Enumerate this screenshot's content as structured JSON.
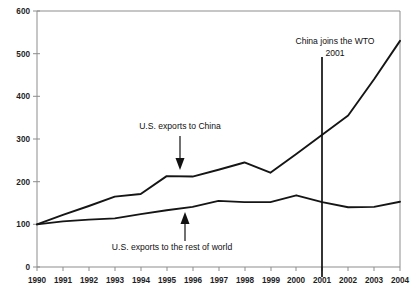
{
  "chart_data": {
    "type": "line",
    "title": "",
    "subtitle": "",
    "xlabel": "",
    "ylabel": "",
    "xlim": [
      1990,
      2004
    ],
    "ylim": [
      0,
      600
    ],
    "grid": false,
    "legend_position": "inline-annotations",
    "x": [
      1990,
      1991,
      1992,
      1993,
      1994,
      1995,
      1996,
      1997,
      1998,
      1999,
      2000,
      2001,
      2002,
      2003,
      2004
    ],
    "xtick_labels": [
      "1990",
      "1991",
      "1992",
      "1993",
      "1994",
      "1995",
      "1996",
      "1997",
      "1998",
      "1999",
      "2000",
      "2001",
      "2002",
      "2003",
      "2004"
    ],
    "ytick_labels": [
      "0",
      "100",
      "200",
      "300",
      "400",
      "500",
      "600"
    ],
    "ytick_values": [
      0,
      100,
      200,
      300,
      400,
      500,
      600
    ],
    "series": [
      {
        "name": "U.S. exports to China",
        "color": "#151515",
        "values": [
          100,
          122,
          143,
          165,
          171,
          213,
          212,
          228,
          245,
          221,
          265,
          310,
          355,
          440,
          530
        ]
      },
      {
        "name": "U.S. exports to the rest of world",
        "color": "#151515",
        "values": [
          100,
          107,
          111,
          114,
          124,
          133,
          141,
          155,
          152,
          152,
          168,
          152,
          140,
          141,
          153
        ]
      }
    ],
    "annotations": [
      {
        "id": "china-series-label",
        "text": "U.S. exports to China",
        "points_to_year": 1995,
        "arrow_direction": "down"
      },
      {
        "id": "rest-of-world-series-label",
        "text": "U.S. exports to the rest of world",
        "points_to_year": 1996,
        "arrow_direction": "up"
      },
      {
        "id": "wto-event",
        "text_line_1": "China joins the WTO",
        "text_line_2": "2001",
        "event_year": 2001,
        "marker": "vertical-line"
      }
    ]
  },
  "axes": {
    "y_ticks": [
      {
        "label": "600",
        "value": 600
      },
      {
        "label": "500",
        "value": 500
      },
      {
        "label": "400",
        "value": 400
      },
      {
        "label": "300",
        "value": 300
      },
      {
        "label": "200",
        "value": 200
      },
      {
        "label": "100",
        "value": 100
      },
      {
        "label": "0",
        "value": 0
      }
    ],
    "x_ticks": [
      {
        "label": "1990"
      },
      {
        "label": "1991"
      },
      {
        "label": "1992"
      },
      {
        "label": "1993"
      },
      {
        "label": "1994"
      },
      {
        "label": "1995"
      },
      {
        "label": "1996"
      },
      {
        "label": "1997"
      },
      {
        "label": "1998"
      },
      {
        "label": "1999"
      },
      {
        "label": "2000"
      },
      {
        "label": "2001"
      },
      {
        "label": "2002"
      },
      {
        "label": "2003"
      },
      {
        "label": "2004"
      }
    ]
  },
  "labels": {
    "china_series": "U.S. exports to China",
    "rest_of_world_series": "U.S. exports to the rest of world",
    "wto_line_1": "China joins the WTO",
    "wto_line_2": "2001"
  },
  "colors": {
    "line": "#151515",
    "axis": "#8d8d8d",
    "text": "#101010",
    "background": "#ffffff"
  }
}
